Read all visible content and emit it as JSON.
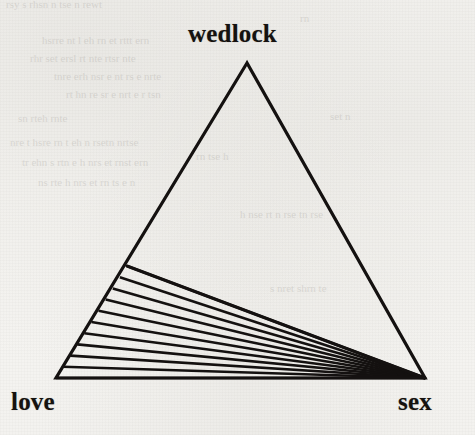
{
  "figure": {
    "kind": "hatched-triangle-diagram",
    "background_color": "#f6f5f2",
    "ink_color": "#141110",
    "labels": {
      "top": "wedlock",
      "bottom_left": "love",
      "bottom_right": "sex"
    }
  },
  "chart_data": {
    "type": "diagram",
    "title": "",
    "subtitle": "",
    "xlabel": "",
    "ylabel": "",
    "grid": false,
    "legend": "none",
    "vertices": [
      {
        "name": "wedlock",
        "label": "wedlock",
        "x": 247,
        "y": 63
      },
      {
        "name": "love",
        "label": "love",
        "x": 56,
        "y": 378
      },
      {
        "name": "sex",
        "label": "sex",
        "x": 425,
        "y": 378
      }
    ],
    "edges": [
      {
        "from": "wedlock",
        "to": "love"
      },
      {
        "from": "wedlock",
        "to": "sex"
      },
      {
        "from": "love",
        "to": "sex"
      }
    ],
    "hatched_region": {
      "name": "love-sex-lower-region",
      "polygon": [
        {
          "x": 127,
          "y": 266
        },
        {
          "x": 56,
          "y": 378
        },
        {
          "x": 425,
          "y": 378
        }
      ],
      "hatch_line_count": 11,
      "hatch_convergence_vertex": "sex",
      "hatch_style": "parallel-fan radiating from sex vertex",
      "fill": "none"
    },
    "stroke_width_outline": 3.2,
    "stroke_width_hatch": 2.6
  }
}
